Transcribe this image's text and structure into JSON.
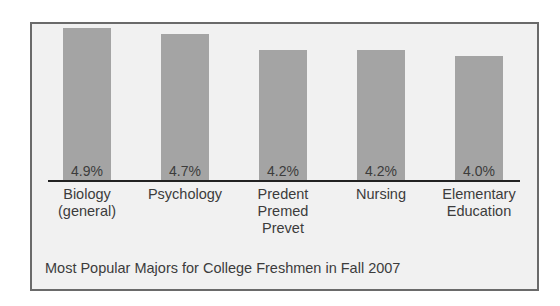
{
  "chart_data": {
    "type": "bar",
    "title": "Most Popular Majors for College Freshmen in Fall 2007",
    "categories": [
      "Biology (general)",
      "Psychology",
      "Predent Premed Prevet",
      "Nursing",
      "Elementary Education"
    ],
    "category_display": [
      "Biology\n(general)",
      "Psychology",
      "Predent\nPremed\nPrevet",
      "Nursing",
      "Elementary\nEducation"
    ],
    "values": [
      4.9,
      4.7,
      4.2,
      4.2,
      4.0
    ],
    "value_labels": [
      "4.9%",
      "4.7%",
      "4.2%",
      "4.2%",
      "4.0%"
    ],
    "xlabel": "",
    "ylabel": "",
    "unit": "%",
    "grid": false,
    "legend": "none",
    "colors": {
      "bar": "#a4a4a4",
      "background": "#f1f1f1",
      "border": "#6a6a6a",
      "axis": "#222222"
    }
  }
}
